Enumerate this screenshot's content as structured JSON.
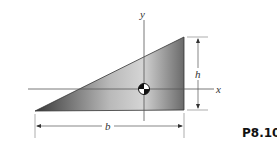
{
  "diagram": {
    "problem_number": "P8.104",
    "labels": {
      "x_axis": "x",
      "y_axis": "y",
      "height": "h",
      "base": "b"
    },
    "shape": "right-triangle",
    "colors": {
      "fill_dark": "#3a3a3a",
      "fill_light": "#cfcfcf",
      "line": "#444444"
    }
  }
}
